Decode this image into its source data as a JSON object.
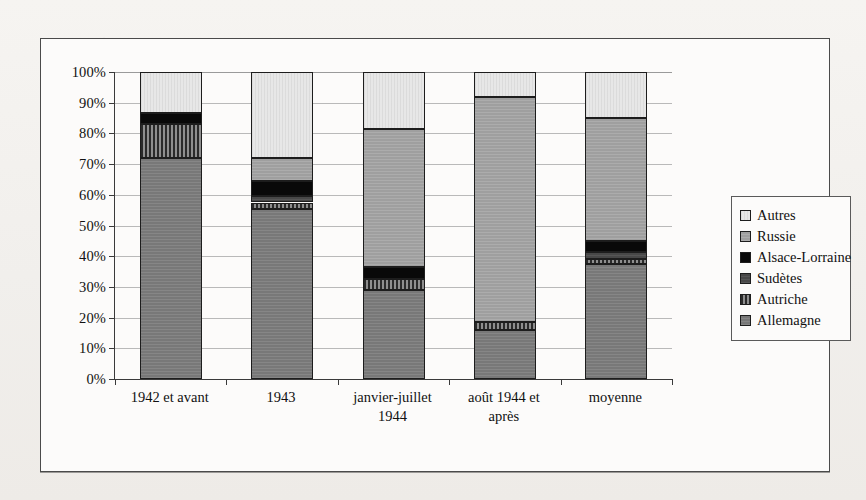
{
  "chart_data": {
    "type": "bar",
    "stacked": true,
    "stack_mode": "percent",
    "title": "",
    "xlabel": "",
    "ylabel": "",
    "ylim": [
      0,
      100
    ],
    "ytick_labels": [
      "0%",
      "10%",
      "20%",
      "30%",
      "40%",
      "50%",
      "60%",
      "70%",
      "80%",
      "90%",
      "100%"
    ],
    "ytick_values": [
      0,
      10,
      20,
      30,
      40,
      50,
      60,
      70,
      80,
      90,
      100
    ],
    "grid": true,
    "legend_position": "right",
    "categories": [
      "1942 et avant",
      "1943",
      "janvier-juillet 1944",
      "août 1944 et après",
      "moyenne"
    ],
    "series": [
      {
        "name": "Allemagne",
        "color": "#7e7e7e",
        "values": [
          72.0,
          55.5,
          29.0,
          16.0,
          37.5
        ]
      },
      {
        "name": "Autriche",
        "color": "#3b3b3b",
        "values": [
          11.0,
          2.0,
          3.5,
          2.5,
          1.5
        ]
      },
      {
        "name": "Sudètes",
        "color": "#4d4d4d",
        "values": [
          0.0,
          2.0,
          0.0,
          0.0,
          2.5
        ]
      },
      {
        "name": "Alsace-Lorraine",
        "color": "#090909",
        "values": [
          3.5,
          5.0,
          4.0,
          0.0,
          3.5
        ]
      },
      {
        "name": "Russie",
        "color": "#a6a6a6",
        "values": [
          0.0,
          7.5,
          45.0,
          73.5,
          40.0
        ]
      },
      {
        "name": "Autres",
        "color": "#e7e7e7",
        "values": [
          13.5,
          28.0,
          18.5,
          8.0,
          15.0
        ]
      }
    ],
    "cumulative_tops": {
      "1942 et avant": {
        "Allemagne": 72.0,
        "Autriche": 83.0,
        "Sudètes": 83.0,
        "Alsace-Lorraine": 86.5,
        "Russie": 86.5,
        "Autres": 100
      },
      "1943": {
        "Allemagne": 55.5,
        "Autriche": 57.5,
        "Sudètes": 59.5,
        "Alsace-Lorraine": 64.5,
        "Russie": 72.0,
        "Autres": 100
      },
      "janvier-juillet 1944": {
        "Allemagne": 29.0,
        "Autriche": 32.5,
        "Sudètes": 32.5,
        "Alsace-Lorraine": 36.5,
        "Russie": 81.5,
        "Autres": 100
      },
      "août 1944 et après": {
        "Allemagne": 16.0,
        "Autriche": 18.5,
        "Sudètes": 18.5,
        "Alsace-Lorraine": 18.5,
        "Russie": 92.0,
        "Autres": 100
      },
      "moyenne": {
        "Allemagne": 37.5,
        "Autriche": 39.0,
        "Sudètes": 41.5,
        "Alsace-Lorraine": 45.0,
        "Russie": 85.0,
        "Autres": 100
      }
    }
  },
  "legend": {
    "items": [
      {
        "label": "Autres",
        "swatch_class": "fill-autres"
      },
      {
        "label": "Russie",
        "swatch_class": "fill-russie"
      },
      {
        "label": "Alsace-Lorraine",
        "swatch_class": "fill-alsace"
      },
      {
        "label": "Sudètes",
        "swatch_class": "fill-sudetes"
      },
      {
        "label": "Autriche",
        "swatch_class": "fill-autriche"
      },
      {
        "label": "Allemagne",
        "swatch_class": "fill-allemagne"
      }
    ]
  },
  "xlabels": [
    "1942 et avant",
    "1943",
    "janvier-juillet\n1944",
    "août 1944 et\naprès",
    "moyenne"
  ]
}
